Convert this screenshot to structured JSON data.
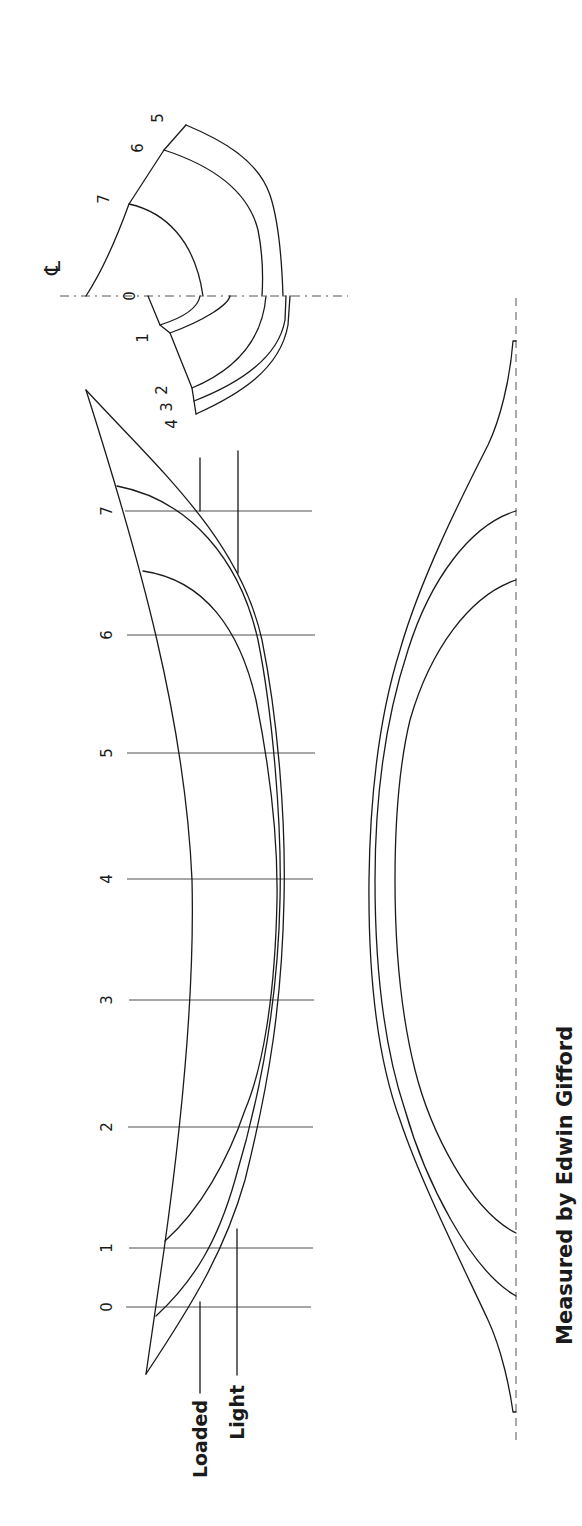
{
  "drawing": {
    "title": "Boat lines plan",
    "orientation": "rotated -90deg (text reads bottom-to-top)",
    "centerline_symbol": "℄",
    "body_plan": {
      "upper_stations": [
        "5",
        "6",
        "7"
      ],
      "lower_stations": [
        "0",
        "1",
        "4 3 2"
      ],
      "lower_label_parts": [
        "2",
        "3",
        "4"
      ]
    },
    "profile": {
      "stations": [
        "0",
        "1",
        "2",
        "3",
        "4",
        "5",
        "6",
        "7"
      ],
      "waterlines": [
        "Loaded",
        "Light"
      ]
    },
    "credit": "Measured by Edwin Gifford"
  }
}
